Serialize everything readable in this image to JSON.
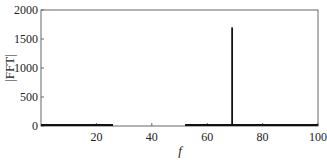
{
  "chart_data": {
    "type": "line",
    "title": "",
    "xlabel": "f",
    "ylabel": "|FFT|",
    "xlim": [
      0,
      100
    ],
    "ylim": [
      0,
      2000
    ],
    "xticks": [
      20,
      40,
      60,
      80,
      100
    ],
    "yticks": [
      0,
      500,
      1000,
      1500,
      2000
    ],
    "grid": false,
    "legend": null,
    "series": [
      {
        "name": "|FFT|",
        "color": "#111111",
        "segments": [
          {
            "x": [
              0,
              26
            ],
            "y": [
              5,
              5
            ]
          },
          {
            "x": [
              52,
              100
            ],
            "y": [
              5,
              5
            ]
          }
        ],
        "peaks": [
          {
            "x": 69,
            "y": 1700
          }
        ]
      }
    ]
  }
}
